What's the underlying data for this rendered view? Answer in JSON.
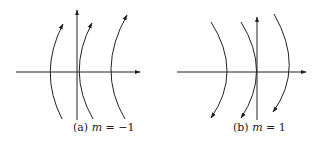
{
  "figure": {
    "panels": [
      {
        "id": "a",
        "label_prefix": "(a) ",
        "var": "m",
        "equals": " = ",
        "value": "−1",
        "flow_direction": "upward",
        "curvature": "concave-right"
      },
      {
        "id": "b",
        "label_prefix": "(b) ",
        "var": "m",
        "equals": " = ",
        "value": "1",
        "flow_direction": "downward",
        "curvature": "concave-left"
      }
    ],
    "colors": {
      "stroke": "#222222",
      "background": "#ffffff"
    }
  }
}
